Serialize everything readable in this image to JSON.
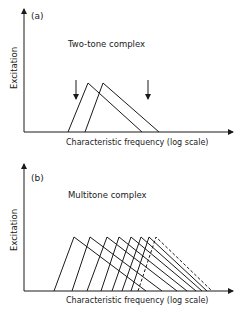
{
  "panels": [
    {
      "id": "a",
      "label": "(a)",
      "title": "Two-tone complex",
      "ylabel": "Excitation",
      "xlabel": "Characteristic frequency (log scale)"
    },
    {
      "id": "b",
      "label": "(b)",
      "title": "Multitone complex",
      "ylabel": "Excitation",
      "xlabel": "Characteristic frequency (log scale)"
    }
  ],
  "chart_data": [
    {
      "type": "diagram",
      "title": "Two-tone complex",
      "panel": "(a)",
      "xlabel": "Characteristic frequency (log scale)",
      "ylabel": "Excitation",
      "excitation_patterns": [
        {
          "left_base": 68,
          "peak": 88,
          "right_base": 142,
          "style": "solid"
        },
        {
          "left_base": 85,
          "peak": 103,
          "right_base": 159,
          "style": "solid"
        }
      ],
      "arrows": [
        76,
        148
      ],
      "color": "#1a1a1a"
    },
    {
      "type": "diagram",
      "title": "Multitone complex",
      "panel": "(b)",
      "xlabel": "Characteristic frequency (log scale)",
      "ylabel": "Excitation",
      "excitation_patterns": [
        {
          "left_base": 54,
          "peak": 74,
          "right_base": 146,
          "style": "solid"
        },
        {
          "left_base": 72,
          "peak": 90,
          "right_base": 162,
          "style": "solid"
        },
        {
          "left_base": 87,
          "peak": 107,
          "right_base": 177,
          "style": "solid"
        },
        {
          "left_base": 101,
          "peak": 119,
          "right_base": 187,
          "style": "solid"
        },
        {
          "left_base": 112,
          "peak": 131,
          "right_base": 196,
          "style": "solid"
        },
        {
          "left_base": 122,
          "peak": 141,
          "right_base": 202,
          "style": "solid"
        },
        {
          "left_base": 131,
          "peak": 149,
          "right_base": 207,
          "style": "solid"
        },
        {
          "left_base": 138,
          "peak": 156,
          "right_base": 212,
          "style": "dashed"
        }
      ],
      "color": "#1a1a1a"
    }
  ]
}
